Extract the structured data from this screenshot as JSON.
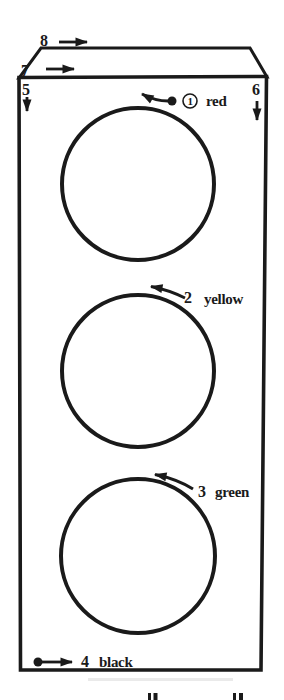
{
  "figure": {
    "box_arrows": [
      {
        "number": "8",
        "direction": "right",
        "location": "above top face"
      },
      {
        "number": "7",
        "direction": "right",
        "location": "on top face"
      },
      {
        "number": "5",
        "direction": "down",
        "location": "front face top-left"
      },
      {
        "number": "6",
        "direction": "down",
        "location": "front face top-right"
      }
    ],
    "lights": [
      {
        "number": "1",
        "label": "red",
        "number_circled": true,
        "has_start_dot": true,
        "arrow": "curved left over circle top"
      },
      {
        "number": "2",
        "label": "yellow",
        "number_circled": false,
        "has_start_dot": false,
        "arrow": "curved left over circle top"
      },
      {
        "number": "3",
        "label": "green",
        "number_circled": false,
        "has_start_dot": false,
        "arrow": "curved left over circle top"
      },
      {
        "number": "4",
        "label": "black",
        "number_circled": false,
        "has_start_dot": true,
        "arrow": "straight right along box bottom"
      }
    ]
  },
  "colors": {
    "ink": "#1a1a1a",
    "background": "#ffffff"
  }
}
